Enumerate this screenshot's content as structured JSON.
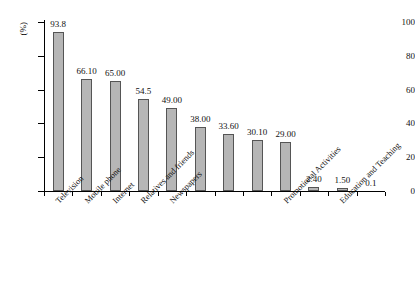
{
  "chart_data": {
    "type": "bar",
    "title": "",
    "subtitle": "",
    "xlabel": "",
    "ylabel": "(%)",
    "ylim": [
      0,
      100
    ],
    "yticks": [
      0,
      20,
      40,
      60,
      80,
      100
    ],
    "ytick_labels": [
      "0",
      "20",
      "40",
      "60",
      "80",
      "100"
    ],
    "grid": false,
    "legend": null,
    "bar_color": "#b6b6b6",
    "bar_edge_color": "#555555",
    "axis_color": "#000000",
    "categories": [
      "Television",
      "Mobile phone",
      "Internet",
      "Relatives and friends",
      "Newspapers",
      "",
      "",
      "",
      "Promotional Activities",
      "",
      "Education and Teaching",
      ""
    ],
    "values": [
      93.8,
      66.1,
      65.0,
      54.5,
      49.0,
      38.0,
      33.6,
      30.1,
      29.0,
      2.4,
      1.5,
      0.1
    ],
    "value_labels": [
      "93.8",
      "66.10",
      "65.00",
      "54.5",
      "49.00",
      "38.00",
      "33.60",
      "30.10",
      "29.00",
      "2.40",
      "1.50",
      "0.1"
    ],
    "visible_category_labels": [
      "Television",
      "Mobile phone",
      "Internet",
      "Relatives and friends",
      "Newspapers",
      "Promotional Activities",
      "Education and Teaching"
    ]
  }
}
